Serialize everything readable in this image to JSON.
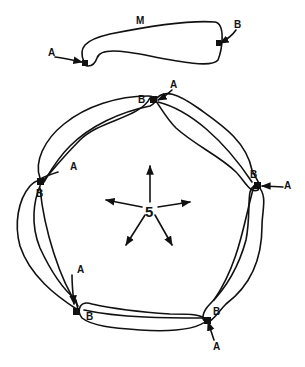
{
  "diagram": {
    "ink_color": "#111111",
    "background": "#ffffff",
    "monomer": {
      "label": "M",
      "site_a_label": "A",
      "site_b_label": "B"
    },
    "ring": {
      "symmetry_label": "5",
      "subunit_count": 5,
      "subunits": [
        {
          "position": "top",
          "site_a_label": "A",
          "site_b_label": "B"
        },
        {
          "position": "right",
          "site_a_label": "A",
          "site_b_label": "B"
        },
        {
          "position": "bottom-right",
          "site_a_label": "A",
          "site_b_label": "B"
        },
        {
          "position": "bottom-left",
          "site_a_label": "A",
          "site_b_label": "B"
        },
        {
          "position": "left",
          "site_a_label": "A",
          "site_b_label": "B"
        }
      ],
      "center_arrows": 5
    }
  }
}
